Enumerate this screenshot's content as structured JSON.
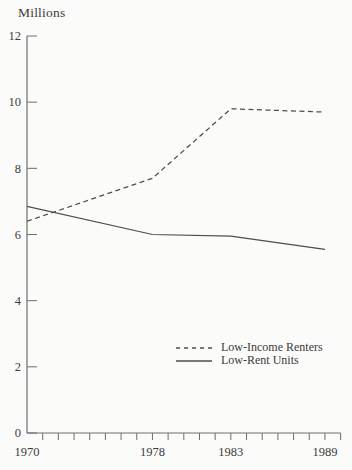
{
  "chart_data": {
    "type": "line",
    "title": "",
    "ylabel": "Millions",
    "xlabel": "",
    "x": [
      1970,
      1978,
      1983,
      1989
    ],
    "series": [
      {
        "name": "Low-Income Renters",
        "style": "dashed",
        "values": [
          6.4,
          7.7,
          9.8,
          9.7
        ]
      },
      {
        "name": "Low-Rent Units",
        "style": "solid",
        "values": [
          6.85,
          6.0,
          5.95,
          5.55
        ]
      }
    ],
    "ylim": [
      0,
      12
    ],
    "yticks": [
      0,
      2,
      4,
      6,
      8,
      10,
      12
    ],
    "x_range": [
      1970,
      1990
    ],
    "xticks_labeled": [
      1970,
      1978,
      1983,
      1989
    ],
    "x_minor_ticks": "every year 1971-1990",
    "grid": "off",
    "legend_position": "center-right",
    "colors": {
      "line": "#4d4d4d",
      "axis": "#6e6e6e",
      "text": "#3c3c3c",
      "background": "#fbfbf9"
    }
  }
}
